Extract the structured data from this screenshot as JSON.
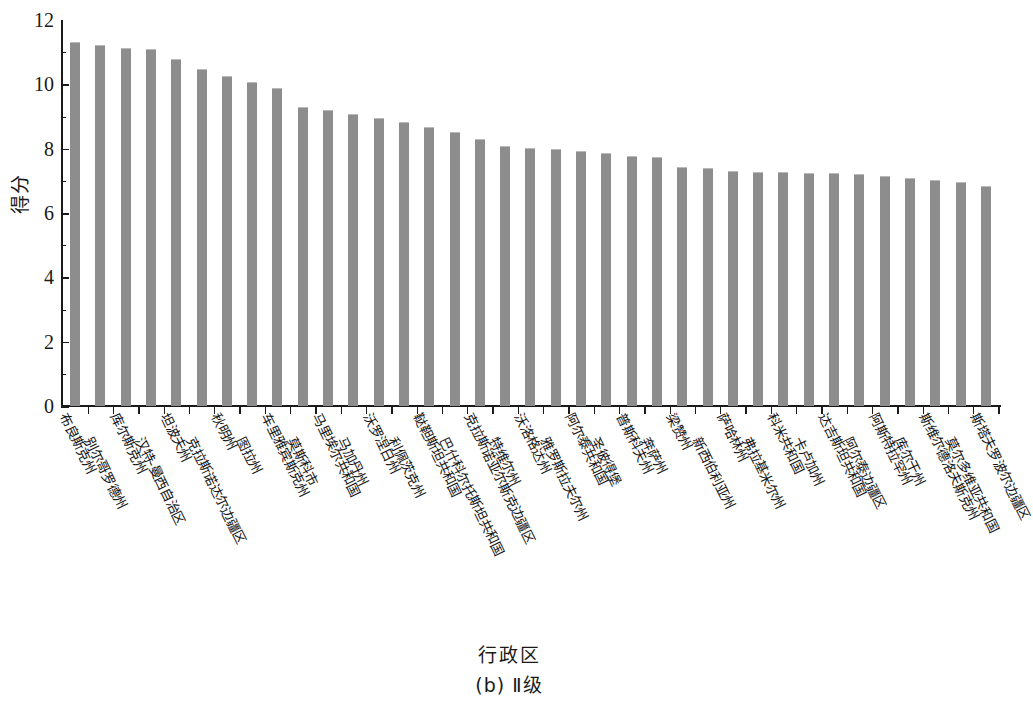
{
  "chart_data": {
    "type": "bar",
    "title": "",
    "subtitle": "",
    "xlabel": "行政区",
    "ylabel": "得分",
    "caption": "(b) Ⅱ级",
    "ylim": [
      0,
      12
    ],
    "ytick_labels": [
      "0",
      "2",
      "4",
      "6",
      "8",
      "10",
      "12"
    ],
    "ytick_values": [
      0,
      2,
      4,
      6,
      8,
      10,
      12
    ],
    "yminor_step": 1,
    "grid": false,
    "legend": null,
    "bar_color": "#8d8d8d",
    "axis_color": "#1a1a1a",
    "categories": [
      "布良斯克州",
      "别尔哥罗德州",
      "库尔斯克州",
      "汉特-曼西自治区",
      "坦波夫州",
      "克拉斯诺达尔边疆区",
      "秋明州",
      "图拉州",
      "车里雅宾斯克州",
      "莫斯科市",
      "马里埃尔共和国",
      "马加丹州",
      "沃罗涅日州",
      "利佩茨克州",
      "鞑靼斯坦共和国",
      "巴什科尔托斯坦共和国",
      "克拉斯诺亚尔斯克边疆区",
      "特维尔州",
      "沃洛格达州",
      "雅罗斯拉夫尔州",
      "阿尔泰共和国",
      "圣彼得堡",
      "普斯科夫州",
      "奔萨州",
      "梁赞州",
      "新西伯利亚州",
      "萨哈林州",
      "弗拉基米尔州",
      "科米共和国",
      "卡卢加州",
      "达吉斯坦共和国",
      "阿尔泰边疆区",
      "阿斯特拉罕州",
      "库尔干州",
      "斯维尔德洛夫斯克州",
      "莫尔多维亚共和国",
      "斯塔夫罗波尔边疆区"
    ],
    "values": [
      11.3,
      11.18,
      11.1,
      11.08,
      10.75,
      10.45,
      10.22,
      10.05,
      9.85,
      9.25,
      9.18,
      9.05,
      8.92,
      8.8,
      8.65,
      8.48,
      8.28,
      8.05,
      7.98,
      7.95,
      7.9,
      7.85,
      7.75,
      7.72,
      7.4,
      7.38,
      7.28,
      7.25,
      7.24,
      7.22,
      7.2,
      7.18,
      7.12,
      7.05,
      6.98,
      6.92,
      6.82
    ]
  }
}
